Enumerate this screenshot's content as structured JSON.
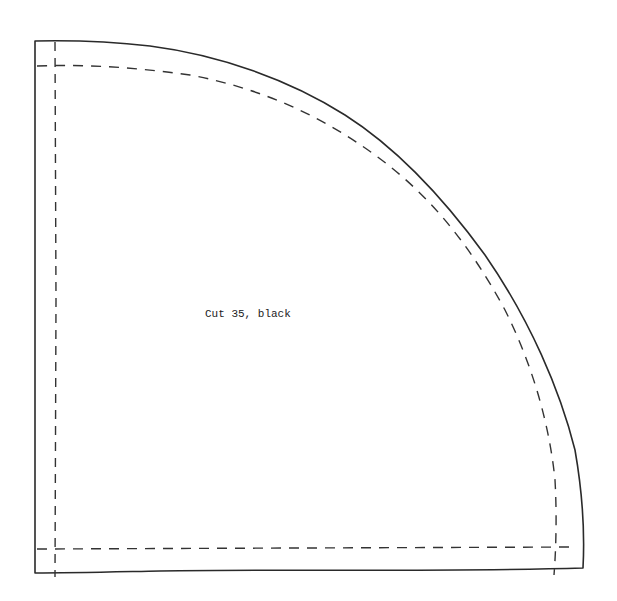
{
  "diagram": {
    "type": "sewing-pattern-template",
    "shape": "quarter-circle",
    "label": "Cut 35, black",
    "colors": {
      "background": "#ffffff",
      "cut_line": "#2a2a2a",
      "seam_line": "#333333",
      "text": "#222222"
    },
    "lines": [
      {
        "name": "cut-line",
        "style": "solid"
      },
      {
        "name": "seam-allowance-line",
        "style": "dashed"
      }
    ]
  }
}
